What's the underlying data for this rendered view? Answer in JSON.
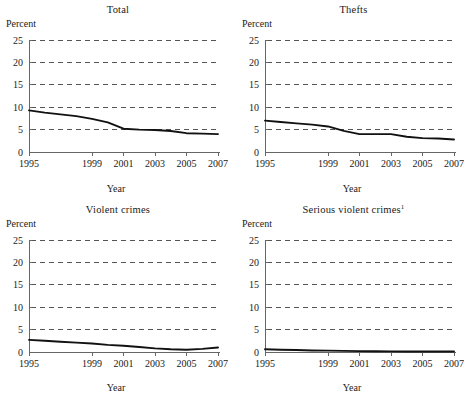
{
  "figure": {
    "panel_count": 4,
    "shared_ylabel": "Percent",
    "shared_xlabel": "Year",
    "line_color": "#111111",
    "gridline_color": "#555555",
    "axis_color": "#666666",
    "background": "#ffffff"
  },
  "chart_data": [
    {
      "type": "line",
      "title": "Total",
      "title_superscript": "",
      "xlabel": "Year",
      "ylabel": "Percent",
      "xlim": [
        1995,
        2007
      ],
      "ylim": [
        0,
        25
      ],
      "yticks": [
        0,
        5,
        10,
        15,
        20,
        25
      ],
      "ytick_labels": [
        "0",
        "5",
        "10",
        "15",
        "20",
        "25"
      ],
      "xticks": [
        1995,
        1999,
        2001,
        2003,
        2005,
        2007
      ],
      "xtick_labels": [
        "1995",
        "1999",
        "2001",
        "2003",
        "2005",
        "2007"
      ],
      "grid": "horizontal-dashed",
      "legend": "none",
      "x": [
        1995,
        1996,
        1997,
        1998,
        1999,
        2000,
        2001,
        2002,
        2003,
        2004,
        2005,
        2006,
        2007
      ],
      "values": [
        9.3,
        8.8,
        8.4,
        8.0,
        7.4,
        6.6,
        5.2,
        5.0,
        4.9,
        4.7,
        4.2,
        4.1,
        4.0
      ]
    },
    {
      "type": "line",
      "title": "Thefts",
      "title_superscript": "",
      "xlabel": "Year",
      "ylabel": "Percent",
      "xlim": [
        1995,
        2007
      ],
      "ylim": [
        0,
        25
      ],
      "yticks": [
        0,
        5,
        10,
        15,
        20,
        25
      ],
      "ytick_labels": [
        "0",
        "5",
        "10",
        "15",
        "20",
        "25"
      ],
      "xticks": [
        1995,
        1999,
        2001,
        2003,
        2005,
        2007
      ],
      "xtick_labels": [
        "1995",
        "1999",
        "2001",
        "2003",
        "2005",
        "2007"
      ],
      "grid": "horizontal-dashed",
      "legend": "none",
      "x": [
        1995,
        1996,
        1997,
        1998,
        1999,
        2000,
        2001,
        2002,
        2003,
        2004,
        2005,
        2006,
        2007
      ],
      "values": [
        7.0,
        6.7,
        6.4,
        6.1,
        5.7,
        4.7,
        4.0,
        4.0,
        4.0,
        3.4,
        3.1,
        3.0,
        2.8
      ]
    },
    {
      "type": "line",
      "title": "Violent crimes",
      "title_superscript": "",
      "xlabel": "Year",
      "ylabel": "Percent",
      "xlim": [
        1995,
        2007
      ],
      "ylim": [
        0,
        25
      ],
      "yticks": [
        0,
        5,
        10,
        15,
        20,
        25
      ],
      "ytick_labels": [
        "0",
        "5",
        "10",
        "15",
        "20",
        "25"
      ],
      "xticks": [
        1995,
        1999,
        2001,
        2003,
        2005,
        2007
      ],
      "xtick_labels": [
        "1995",
        "1999",
        "2001",
        "2003",
        "2005",
        "2007"
      ],
      "grid": "horizontal-dashed",
      "legend": "none",
      "x": [
        1995,
        1996,
        1997,
        1998,
        1999,
        2000,
        2001,
        2002,
        2003,
        2004,
        2005,
        2006,
        2007
      ],
      "values": [
        2.7,
        2.5,
        2.3,
        2.1,
        1.9,
        1.6,
        1.4,
        1.1,
        0.8,
        0.6,
        0.5,
        0.7,
        1.0
      ]
    },
    {
      "type": "line",
      "title": "Serious violent crimes",
      "title_superscript": "1",
      "xlabel": "Year",
      "ylabel": "Percent",
      "xlim": [
        1995,
        2007
      ],
      "ylim": [
        0,
        25
      ],
      "yticks": [
        0,
        5,
        10,
        15,
        20,
        25
      ],
      "ytick_labels": [
        "0",
        "5",
        "10",
        "15",
        "20",
        "25"
      ],
      "xticks": [
        1995,
        1999,
        2001,
        2003,
        2005,
        2007
      ],
      "xtick_labels": [
        "1995",
        "1999",
        "2001",
        "2003",
        "2005",
        "2007"
      ],
      "grid": "horizontal-dashed",
      "legend": "none",
      "x": [
        1995,
        1996,
        1997,
        1998,
        1999,
        2000,
        2001,
        2002,
        2003,
        2004,
        2005,
        2006,
        2007
      ],
      "values": [
        0.6,
        0.5,
        0.45,
        0.35,
        0.3,
        0.25,
        0.2,
        0.18,
        0.15,
        0.12,
        0.1,
        0.1,
        0.1
      ]
    }
  ]
}
